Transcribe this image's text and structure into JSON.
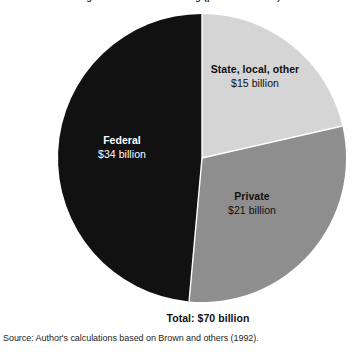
{
  "figure": {
    "title_remnant": "Figure. Sources of funding (percent of total)",
    "total_caption": "Total: $70 billion",
    "source_note": "Source: Author's calculations based on Brown and others (1992)."
  },
  "chart_data": {
    "type": "pie",
    "title": "",
    "unit": "billion dollars",
    "total": 70,
    "total_label": "Total: $70 billion",
    "start_angle_deg": 0,
    "direction": "clockwise",
    "center": {
      "x": 202,
      "y": 158
    },
    "radius": 144,
    "legend": "none",
    "labels_placement": "inside-slices",
    "categories": [
      "State, local, other",
      "Private",
      "Federal"
    ],
    "values": [
      15,
      21,
      34
    ],
    "value_labels": [
      "$15 billion",
      "$21 billion",
      "$34 billion"
    ],
    "percentages": [
      21.4,
      30.0,
      48.6
    ],
    "colors": [
      "#d5d5d5",
      "#8e8e8e",
      "#111111"
    ],
    "slices": [
      {
        "name": "State, local, other",
        "value": 15,
        "value_label": "$15 billion",
        "percent": 21.4,
        "color": "#d5d5d5",
        "label_color": "#111111",
        "start_deg": 0,
        "end_deg": 77.1
      },
      {
        "name": "Private",
        "value": 21,
        "value_label": "$21 billion",
        "percent": 30.0,
        "color": "#8e8e8e",
        "label_color": "#111111",
        "start_deg": 77.1,
        "end_deg": 185.1
      },
      {
        "name": "Federal",
        "value": 34,
        "value_label": "$34 billion",
        "percent": 48.6,
        "color": "#111111",
        "label_color": "#ffffff",
        "start_deg": 185.1,
        "end_deg": 360
      }
    ]
  },
  "palette": {
    "background": "#ffffff",
    "slice_light": "#d5d5d5",
    "slice_medium": "#8e8e8e",
    "slice_dark": "#111111",
    "text_dark": "#111111",
    "text_light": "#ffffff",
    "divider": "#ffffff"
  }
}
